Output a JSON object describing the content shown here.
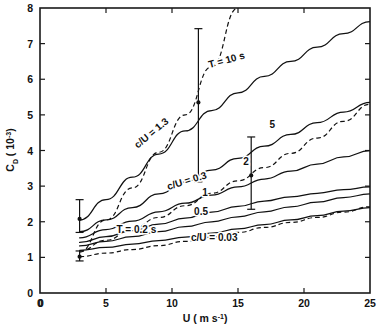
{
  "chart_data": {
    "type": "line",
    "title": "",
    "xlabel": "U  ( m s⁻¹)",
    "ylabel": "Cᴅ  ( 10⁻³)",
    "xlim": [
      0,
      25
    ],
    "ylim": [
      0,
      8
    ],
    "xticks": [
      0,
      5,
      10,
      15,
      20,
      25
    ],
    "xticklabels": [
      "0",
      "5",
      "10",
      "15",
      "20",
      "25"
    ],
    "yticks": [
      0,
      1,
      2,
      3,
      4,
      5,
      6,
      7,
      8
    ],
    "yticklabels": [
      "0",
      "1",
      "2",
      "3",
      "4",
      "5",
      "6",
      "7",
      "8"
    ],
    "grid": false,
    "legend": "inline-curve-labels",
    "series": [
      {
        "name": "T = 10 s",
        "style": "solid",
        "label": "T = 10 s",
        "label_x": 14.2,
        "label_y": 6.45,
        "label_rotation": -15,
        "x": [
          3,
          5,
          7,
          9,
          11,
          13,
          15,
          17,
          19,
          21,
          23,
          25
        ],
        "y": [
          2.05,
          2.62,
          3.25,
          3.9,
          4.55,
          5.12,
          5.62,
          6.08,
          6.5,
          6.9,
          7.28,
          7.62
        ]
      },
      {
        "name": "T = 5 s",
        "style": "solid",
        "label": "5",
        "label_x": 17.6,
        "label_y": 4.62,
        "label_rotation": 0,
        "x": [
          3,
          5,
          7,
          9,
          11,
          13,
          15,
          17,
          19,
          21,
          23,
          25
        ],
        "y": [
          1.72,
          2.05,
          2.4,
          2.78,
          3.12,
          3.45,
          3.78,
          4.12,
          4.45,
          4.78,
          5.08,
          5.35
        ]
      },
      {
        "name": "T = 2 s",
        "style": "solid",
        "label": "2",
        "label_x": 15.6,
        "label_y": 3.58,
        "label_rotation": 0,
        "x": [
          3,
          5,
          7,
          9,
          11,
          13,
          15,
          17,
          19,
          21,
          23,
          25
        ],
        "y": [
          1.55,
          1.78,
          2.02,
          2.28,
          2.52,
          2.75,
          2.98,
          3.2,
          3.42,
          3.62,
          3.82,
          4.0
        ]
      },
      {
        "name": "T = 1 s",
        "style": "solid",
        "label": "1",
        "label_x": 12.5,
        "label_y": 2.72,
        "label_rotation": 0,
        "x": [
          3,
          5,
          7,
          9,
          11,
          13,
          15,
          17,
          19,
          21,
          23,
          25
        ],
        "y": [
          1.42,
          1.58,
          1.75,
          1.93,
          2.1,
          2.27,
          2.43,
          2.58,
          2.7,
          2.8,
          2.9,
          2.98
        ]
      },
      {
        "name": "T = 0.5 s",
        "style": "solid",
        "label": "0.5",
        "label_x": 12.2,
        "label_y": 2.2,
        "label_rotation": 0,
        "x": [
          3,
          5,
          7,
          9,
          11,
          13,
          15,
          17,
          19,
          21,
          23,
          25
        ],
        "y": [
          1.32,
          1.45,
          1.58,
          1.72,
          1.86,
          2.0,
          2.14,
          2.28,
          2.42,
          2.55,
          2.68,
          2.78
        ]
      },
      {
        "name": "T = 0.2 s",
        "style": "solid",
        "label": "T = 0.2 s",
        "label_x": 7.3,
        "label_y": 1.68,
        "label_rotation": 0,
        "x": [
          3,
          5,
          7,
          9,
          11,
          13,
          15,
          17,
          19,
          21,
          23,
          25
        ],
        "y": [
          1.2,
          1.28,
          1.37,
          1.47,
          1.57,
          1.68,
          1.8,
          1.92,
          2.05,
          2.17,
          2.3,
          2.4
        ]
      },
      {
        "name": "c/U = 1.3",
        "style": "dashed",
        "label": "c/U = 1.3",
        "label_x": 8.6,
        "label_y": 4.42,
        "label_rotation": -40,
        "x": [
          3,
          5,
          7,
          9,
          11,
          13,
          15
        ],
        "y": [
          1.15,
          2.05,
          2.95,
          3.95,
          5.0,
          6.35,
          8.0
        ]
      },
      {
        "name": "c/U = 0.3",
        "style": "dashed",
        "label": "c/U = 0.3",
        "label_x": 11.2,
        "label_y": 3.06,
        "label_rotation": -17,
        "x": [
          3,
          5,
          7,
          9,
          11,
          13,
          15,
          17,
          19,
          21,
          23,
          25
        ],
        "y": [
          1.18,
          1.48,
          1.8,
          2.12,
          2.45,
          2.8,
          3.15,
          3.52,
          3.92,
          4.35,
          4.82,
          5.3
        ]
      },
      {
        "name": "c/U = 0.03",
        "style": "dashed",
        "label": "c/U = 0.03",
        "label_x": 13.2,
        "label_y": 1.47,
        "label_rotation": 0,
        "x": [
          3,
          5,
          7,
          9,
          11,
          13,
          15,
          17,
          19,
          21,
          23,
          25
        ],
        "y": [
          1.02,
          1.12,
          1.22,
          1.33,
          1.45,
          1.57,
          1.7,
          1.84,
          1.98,
          2.12,
          2.27,
          2.42
        ]
      }
    ],
    "error_bars": [
      {
        "name": "errorbar-u3-upper",
        "x": 3.0,
        "y": 2.08,
        "ymin": 1.7,
        "ymax": 2.62,
        "marker": true
      },
      {
        "name": "errorbar-u3-lower",
        "x": 3.0,
        "y": 1.02,
        "ymin": 0.9,
        "ymax": 1.18,
        "marker": true
      },
      {
        "name": "errorbar-u12",
        "x": 12.0,
        "y": 5.35,
        "ymin": 3.12,
        "ymax": 7.42,
        "marker": true
      },
      {
        "name": "errorbar-u16",
        "x": 16.0,
        "y": 3.3,
        "ymin": 2.35,
        "ymax": 4.38,
        "marker": true
      }
    ]
  }
}
